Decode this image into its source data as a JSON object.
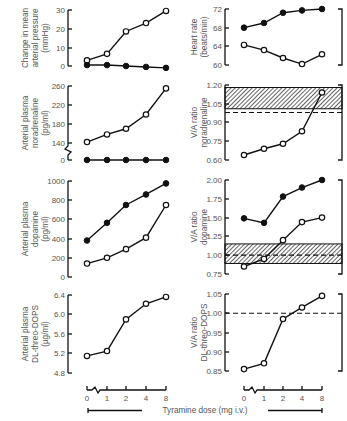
{
  "figure": {
    "xlabel": "Tyramine dose (mg i.v.)",
    "x_ticks": [
      "0",
      "1",
      "2",
      "4",
      "8"
    ]
  },
  "chart_data": [
    {
      "id": "map",
      "type": "line",
      "ylabel_lines": [
        "Change in mean",
        "arterial pressure",
        "(mmHg)"
      ],
      "x": [
        0,
        1,
        2,
        4,
        8
      ],
      "y_ticks": [
        "30",
        "20",
        "10",
        "0"
      ],
      "ylim": [
        0,
        30
      ],
      "series": [
        {
          "name": "open",
          "marker": "open-circle",
          "values": [
            3,
            6.5,
            18.5,
            23,
            29.5
          ]
        },
        {
          "name": "filled",
          "marker": "filled-circle",
          "values": [
            0.5,
            0.5,
            0,
            -0.5,
            -1
          ]
        }
      ]
    },
    {
      "id": "heart_rate",
      "type": "line",
      "ylabel_lines": [
        "Heart rate",
        "(beats/min)"
      ],
      "x": [
        0,
        1,
        2,
        4,
        8
      ],
      "y_ticks": [
        "72",
        "68",
        "64",
        "60"
      ],
      "ylim": [
        60,
        72
      ],
      "series": [
        {
          "name": "filled",
          "marker": "filled-circle",
          "values": [
            68,
            69,
            71.2,
            71.7,
            72
          ]
        },
        {
          "name": "open",
          "marker": "open-circle",
          "values": [
            64.3,
            63.2,
            61.5,
            60.2,
            62.3
          ]
        }
      ]
    },
    {
      "id": "noradrenaline",
      "type": "line",
      "ylabel_lines": [
        "Arterial plasma",
        "noradrenaline",
        "(pg/ml)"
      ],
      "x": [
        0,
        1,
        2,
        4,
        8
      ],
      "y_ticks": [
        "260",
        "220",
        "180",
        "140",
        "0"
      ],
      "ylim": [
        0,
        260
      ],
      "axis_break": true,
      "series": [
        {
          "name": "open",
          "marker": "open-circle",
          "values": [
            142,
            158,
            170,
            200,
            255
          ]
        },
        {
          "name": "filled",
          "marker": "filled-circle",
          "values": [
            0,
            0,
            0,
            0,
            0
          ]
        }
      ]
    },
    {
      "id": "va_noradrenaline",
      "type": "line",
      "ylabel_lines": [
        "V/A ratio",
        "noradrenaline"
      ],
      "x": [
        0,
        1,
        2,
        4,
        8
      ],
      "y_ticks": [
        "1.20",
        "1.05",
        "0.90",
        "0.75",
        "0.60"
      ],
      "ylim": [
        0.6,
        1.2
      ],
      "reference_line": 0.98,
      "shaded_band": [
        1.01,
        1.18
      ],
      "series": [
        {
          "name": "open",
          "marker": "open-circle",
          "values": [
            0.64,
            0.69,
            0.73,
            0.83,
            1.14
          ]
        }
      ]
    },
    {
      "id": "dopamine",
      "type": "line",
      "ylabel_lines": [
        "Arterial plasma",
        "dopamine",
        "(pg/ml)"
      ],
      "x": [
        0,
        1,
        2,
        4,
        8
      ],
      "y_ticks": [
        "1000",
        "800",
        "600",
        "400",
        "200",
        "0"
      ],
      "ylim": [
        0,
        1000
      ],
      "series": [
        {
          "name": "filled",
          "marker": "filled-circle",
          "values": [
            380,
            565,
            750,
            860,
            975
          ]
        },
        {
          "name": "open",
          "marker": "open-circle",
          "values": [
            140,
            200,
            290,
            410,
            750
          ]
        }
      ]
    },
    {
      "id": "va_dopamine",
      "type": "line",
      "ylabel_lines": [
        "V/A ratio",
        "dopamine"
      ],
      "x": [
        0,
        1,
        2,
        4,
        8
      ],
      "y_ticks": [
        "2.00",
        "1.75",
        "1.50",
        "1.25",
        "1.00",
        "0.75"
      ],
      "ylim": [
        0.75,
        2.0
      ],
      "reference_line": 1.0,
      "shaded_band": [
        0.89,
        1.15
      ],
      "series": [
        {
          "name": "filled",
          "marker": "filled-circle",
          "values": [
            1.49,
            1.43,
            1.78,
            1.9,
            2.0
          ]
        },
        {
          "name": "open",
          "marker": "open-circle",
          "values": [
            0.85,
            0.95,
            1.2,
            1.44,
            1.5
          ]
        }
      ]
    },
    {
      "id": "dops",
      "type": "line",
      "ylabel_lines": [
        "Arterial plasma",
        "DL-threo-DOPS",
        "(µg/ml)"
      ],
      "x": [
        0,
        1,
        2,
        4,
        8
      ],
      "y_ticks": [
        "6.4",
        "6.0",
        "5.6",
        "5.2",
        "4.8"
      ],
      "ylim": [
        4.8,
        6.4
      ],
      "series": [
        {
          "name": "open",
          "marker": "open-circle",
          "values": [
            5.15,
            5.25,
            5.9,
            6.22,
            6.36
          ]
        }
      ]
    },
    {
      "id": "va_dops",
      "type": "line",
      "ylabel_lines": [
        "V/A ratio",
        "DL-threo-DOPS"
      ],
      "x": [
        0,
        1,
        2,
        4,
        8
      ],
      "y_ticks": [
        "1.05",
        "1.00",
        "0.95",
        "0.90",
        "0.85"
      ],
      "ylim": [
        0.85,
        1.05
      ],
      "reference_line": 1.0,
      "series": [
        {
          "name": "open",
          "marker": "open-circle",
          "values": [
            0.855,
            0.87,
            0.985,
            1.015,
            1.045
          ]
        }
      ]
    }
  ]
}
